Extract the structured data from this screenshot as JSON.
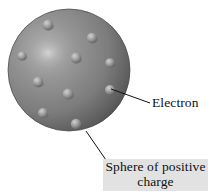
{
  "figure": {
    "background_color": "#ffffff"
  },
  "sphere": {
    "name": "positive-charge-sphere",
    "center_x": 69,
    "center_y": 70,
    "radius": 61,
    "fill_mid": "#8a8a8a",
    "fill_highlight": "#c9c9c9",
    "fill_shadow": "#3f3f3f",
    "edge_color": "#4a4a4a",
    "highlight_x": 48,
    "highlight_y": 52
  },
  "electrons": [
    {
      "x": 48,
      "y": 25,
      "r": 5.4
    },
    {
      "x": 92,
      "y": 38,
      "r": 5.2
    },
    {
      "x": 22,
      "y": 56,
      "r": 4.6
    },
    {
      "x": 76,
      "y": 58,
      "r": 5.4
    },
    {
      "x": 110,
      "y": 63,
      "r": 4.8
    },
    {
      "x": 38,
      "y": 82,
      "r": 5.2
    },
    {
      "x": 68,
      "y": 94,
      "r": 5.4
    },
    {
      "x": 110,
      "y": 90,
      "r": 5.0
    },
    {
      "x": 43,
      "y": 113,
      "r": 5.0
    },
    {
      "x": 76,
      "y": 124,
      "r": 5.2
    }
  ],
  "leader_lines": [
    {
      "name": "electron-leader-line",
      "x1": 111,
      "y1": 89,
      "x2": 150,
      "y2": 103,
      "color": "#111111"
    },
    {
      "name": "sphere-leader-line",
      "x1": 86,
      "y1": 131,
      "x2": 106,
      "y2": 160,
      "color": "#111111"
    }
  ],
  "labels": {
    "electron": {
      "text": "Electron",
      "color": "#111111"
    },
    "sphere_of_positive_charge": {
      "line1": "Sphere of positive",
      "line2": "charge",
      "color": "#111111",
      "background_color": "#e2e2e2"
    }
  }
}
